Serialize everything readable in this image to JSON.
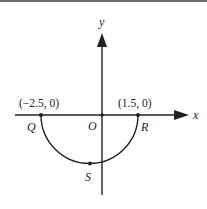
{
  "diagram": {
    "type": "coordinate-plane-semicircle",
    "axes": {
      "x_label": "x",
      "y_label": "y",
      "origin_label": "O"
    },
    "points": [
      {
        "name": "Q",
        "label": "Q",
        "coord_label": "(−2.5, 0)",
        "x": -2.5,
        "y": 0
      },
      {
        "name": "R",
        "label": "R",
        "coord_label": "(1.5, 0)",
        "x": 1.5,
        "y": 0
      },
      {
        "name": "S",
        "label": "S",
        "coord_label": "",
        "position": "lowest point of semicircle"
      }
    ],
    "curve": {
      "kind": "semicircle",
      "endpoints": [
        "Q",
        "R"
      ],
      "side": "below x-axis",
      "center_x": -0.5,
      "radius": 2
    },
    "colors": {
      "stroke": "#222222",
      "background": "#ffffff",
      "top_rule": "#6f6f6f"
    }
  }
}
